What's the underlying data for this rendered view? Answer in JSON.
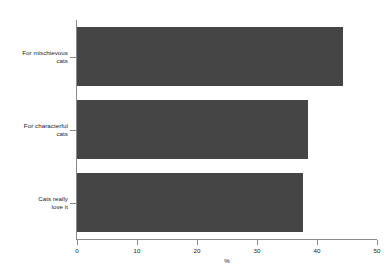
{
  "chart": {
    "title": "",
    "background_color": "#ffffff",
    "bar_color": "#454545",
    "axis_color": "#8a8a8a",
    "text_color": "#1a1a1a"
  },
  "chart_data": {
    "type": "bar",
    "orientation": "horizontal",
    "title": "",
    "subtitle": "",
    "xlabel": "%",
    "ylabel": "",
    "xlim": [
      0,
      50
    ],
    "xticks": [
      0,
      10,
      20,
      30,
      40,
      50
    ],
    "xtick_labels": [
      "0",
      "10",
      "20",
      "30",
      "40",
      "50"
    ],
    "grid": false,
    "legend": false,
    "categories": [
      "For mischievous\ncats",
      "For characterful\ncats",
      "Cats really\nlove it"
    ],
    "values": [
      44.3,
      38.5,
      37.7
    ],
    "series": [
      {
        "name": "%",
        "values": [
          44.3,
          38.5,
          37.7
        ]
      }
    ]
  }
}
